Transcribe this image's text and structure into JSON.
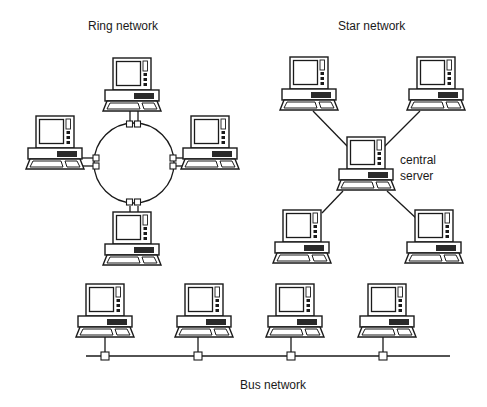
{
  "diagram": {
    "ring": {
      "title": "Ring network",
      "nodes": [
        "computer-top",
        "computer-left",
        "computer-right",
        "computer-bottom"
      ],
      "connection": "closed ring with paired connectors per node"
    },
    "star": {
      "title": "Star network",
      "hub_label_line1": "central",
      "hub_label_line2": "server",
      "nodes": [
        "computer-top-left",
        "computer-top-right",
        "computer-bottom-left",
        "computer-bottom-right"
      ],
      "connection": "each node linked directly to the central server"
    },
    "bus": {
      "title": "Bus network",
      "nodes": [
        "computer-1",
        "computer-2",
        "computer-3",
        "computer-4"
      ],
      "connection": "single shared backbone line with one tap per node"
    },
    "colors": {
      "line": "#1a1a1a",
      "background": "#ffffff",
      "panel": "#2a2a2a"
    }
  }
}
